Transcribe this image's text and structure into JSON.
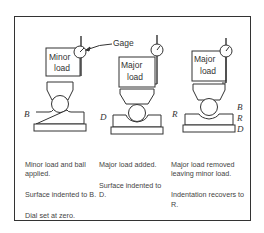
{
  "figure": {
    "gage_label": "Gage",
    "stations": [
      {
        "load_label_line1": "Minor",
        "load_label_line2": "load",
        "marker_labels": [
          "B"
        ],
        "caption": [
          "Minor load and ball applied.",
          "Surface indented to B.",
          "Dial set at zero."
        ]
      },
      {
        "load_label_line1": "Major",
        "load_label_line2": "load",
        "marker_labels": [
          "D"
        ],
        "caption": [
          "Major load added.",
          "Surface indented to D."
        ]
      },
      {
        "load_label_line1": "Major",
        "load_label_line2": "load",
        "marker_labels": [
          "R"
        ],
        "side_labels": [
          "B",
          "R",
          "D"
        ],
        "caption": [
          "Major load removed leaving minor load.",
          "Indentation recovers to R."
        ]
      }
    ],
    "colors": {
      "line": "#333333",
      "text": "#444444"
    }
  }
}
